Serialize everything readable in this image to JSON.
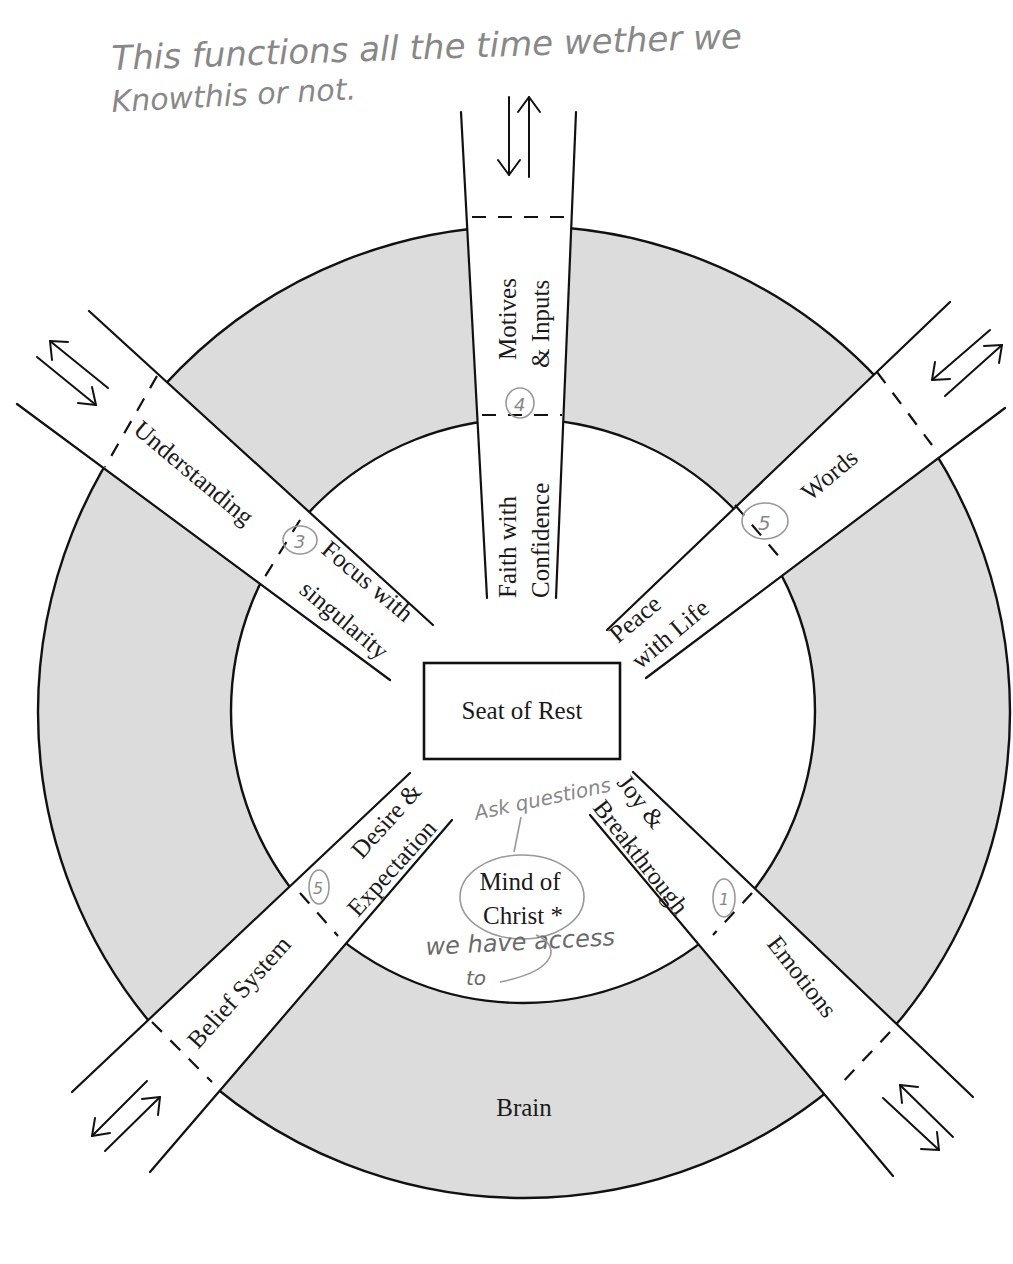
{
  "annotations": {
    "top_note_line1": "This functions all the time wether we",
    "top_note_line2": "Knowthis or not.",
    "ask_questions": "Ask questions",
    "we_have_access": "we have access",
    "to": "to"
  },
  "center": {
    "box_label": "Seat of Rest",
    "mind_line1": "Mind of",
    "mind_line2": "Christ *"
  },
  "ring": {
    "label": "Brain",
    "fill_color": "#dcdcdc"
  },
  "channels": [
    {
      "position": "top",
      "outer_label_1": "Motives",
      "outer_label_2": "& Inputs",
      "inner_label_1": "Faith with",
      "inner_label_2": "Confidence",
      "number": "4"
    },
    {
      "position": "upper-left",
      "outer_label": "Understanding",
      "inner_label_1": "Focus with",
      "inner_label_2": "singularity",
      "number": "3"
    },
    {
      "position": "upper-right",
      "outer_label": "Words",
      "inner_label_1": "Peace",
      "inner_label_2": "with Life",
      "number": "5"
    },
    {
      "position": "lower-left",
      "outer_label": "Belief System",
      "inner_label_1": "Desire &",
      "inner_label_2": "Expectation",
      "number": "5"
    },
    {
      "position": "lower-right",
      "outer_label": "Emotions",
      "inner_label_1": "Joy &",
      "inner_label_2": "Breakthrough",
      "number": "1"
    }
  ],
  "colors": {
    "ink": "#111111",
    "pencil": "#888888",
    "ring_gray": "#dcdcdc",
    "paper": "#ffffff"
  }
}
